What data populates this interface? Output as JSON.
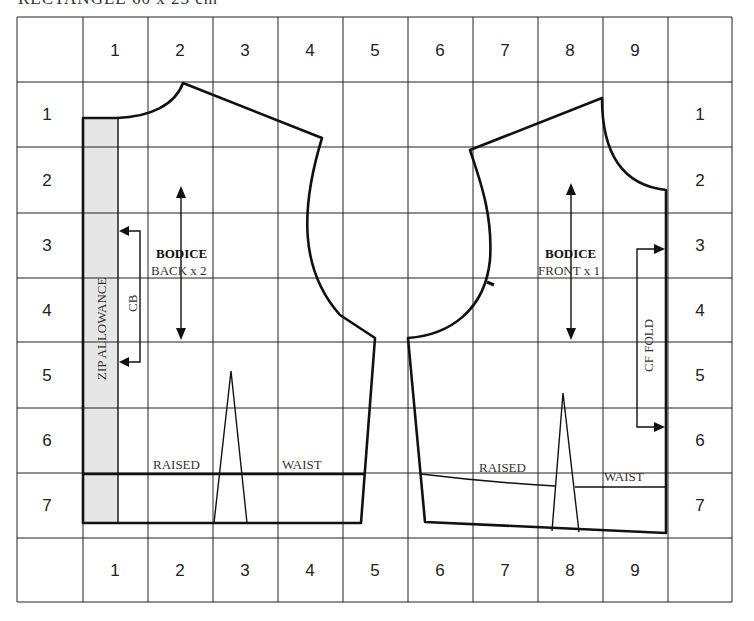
{
  "title": "RECTANGLE 60 x 25 cm",
  "grid": {
    "columns": [
      "1",
      "2",
      "3",
      "4",
      "5",
      "6",
      "7",
      "8",
      "9"
    ],
    "rows": [
      "1",
      "2",
      "3",
      "4",
      "5",
      "6",
      "7"
    ]
  },
  "pieces": {
    "back": {
      "name": "BODICE",
      "cut": "BACK x 2",
      "zip_allowance": "ZIP ALLOWANCE",
      "cb_label": "CB",
      "raised_label": "RAISED",
      "waist_label": "WAIST"
    },
    "front": {
      "name": "BODICE",
      "cut": "FRONT x 1",
      "fold_label": "CF FOLD",
      "raised_label": "RAISED",
      "waist_label": "WAIST"
    }
  },
  "colors": {
    "line": "#111111",
    "grid": "#222222",
    "zip_fill": "#e6e6e6"
  }
}
